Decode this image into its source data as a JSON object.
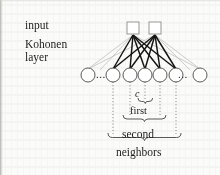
{
  "figure": {
    "background_color": "#fbfbfa",
    "ink_color": "#1d1d1d",
    "faint_line_color": "#b9b9b4"
  },
  "labels": {
    "input": "input",
    "kohonen": "Kohonen",
    "layer": "layer",
    "winner": "c",
    "first": "first",
    "second": "second",
    "neighbors": "neighbors",
    "ellipsis_left": "...",
    "ellipsis_right": "..."
  },
  "diagram_data": {
    "type": "neural-network",
    "input_layer": {
      "node_shape": "square",
      "count": 2,
      "nodes": [
        {
          "id": "in-1",
          "cx": 133,
          "cy": 28,
          "size": 12
        },
        {
          "id": "in-2",
          "cx": 155,
          "cy": 28,
          "size": 12
        }
      ]
    },
    "kohonen_layer": {
      "node_shape": "circle",
      "row_y": 75,
      "radius": 7,
      "total_drawn": 7,
      "nodes": [
        {
          "id": "k-far-left",
          "cx": 88,
          "highlighted": false,
          "has_dotted_drop": false
        },
        {
          "id": "k-1",
          "cx": 113,
          "highlighted": true,
          "has_dotted_drop": true
        },
        {
          "id": "k-2",
          "cx": 130,
          "highlighted": true,
          "has_dotted_drop": true
        },
        {
          "id": "k-c",
          "cx": 145,
          "highlighted": true,
          "has_dotted_drop": true
        },
        {
          "id": "k-3",
          "cx": 160,
          "highlighted": true,
          "has_dotted_drop": true
        },
        {
          "id": "k-4",
          "cx": 176,
          "highlighted": true,
          "has_dotted_drop": true
        },
        {
          "id": "k-far-right",
          "cx": 200,
          "highlighted": false,
          "has_dotted_drop": false
        }
      ]
    },
    "connections": {
      "style": "fully-connected",
      "bold_targets": [
        "k-1",
        "k-2",
        "k-c",
        "k-3",
        "k-4"
      ],
      "faint_targets": [
        "k-far-left",
        "k-far-right"
      ]
    },
    "braces": [
      {
        "id": "brace-c",
        "label": "c",
        "from_x": 138,
        "to_x": 153,
        "y": 100
      },
      {
        "id": "brace-first",
        "label": "first",
        "from_x": 123,
        "to_x": 168,
        "y": 117
      },
      {
        "id": "brace-second",
        "label": "second",
        "from_x": 108,
        "to_x": 183,
        "y": 135
      }
    ]
  }
}
